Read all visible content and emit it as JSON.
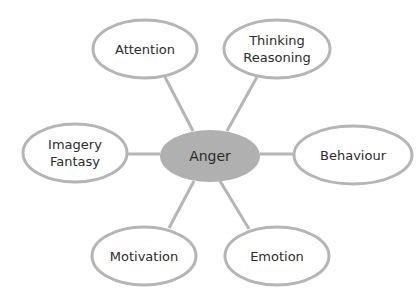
{
  "diagram": {
    "type": "mind-map",
    "colors": {
      "stroke": "#b5b5b5",
      "center_fill": "#b0b0b0",
      "node_fill": "#ffffff",
      "text": "#2b2b2b"
    },
    "center": {
      "label": "Anger",
      "cx": 210,
      "cy": 156,
      "rx": 50,
      "ry": 26
    },
    "nodes": [
      {
        "id": "attention",
        "lines": [
          "Attention"
        ],
        "cx": 145,
        "cy": 49,
        "rx": 52,
        "ry": 29
      },
      {
        "id": "thinking-reasoning",
        "lines": [
          "Thinking",
          "Reasoning"
        ],
        "cx": 277,
        "cy": 49,
        "rx": 53,
        "ry": 29
      },
      {
        "id": "imagery-fantasy",
        "lines": [
          "Imagery",
          "Fantasy"
        ],
        "cx": 75,
        "cy": 153,
        "rx": 52,
        "ry": 29
      },
      {
        "id": "behaviour",
        "lines": [
          "Behaviour"
        ],
        "cx": 353,
        "cy": 155,
        "rx": 59,
        "ry": 29
      },
      {
        "id": "motivation",
        "lines": [
          "Motivation"
        ],
        "cx": 144,
        "cy": 256,
        "rx": 52,
        "ry": 29
      },
      {
        "id": "emotion",
        "lines": [
          "Emotion"
        ],
        "cx": 277,
        "cy": 256,
        "rx": 52,
        "ry": 29
      }
    ],
    "edges": [
      {
        "from": "anger",
        "to": "attention",
        "x1": 193,
        "y1": 131,
        "x2": 165,
        "y2": 77
      },
      {
        "from": "anger",
        "to": "thinking-reasoning",
        "x1": 227,
        "y1": 131,
        "x2": 257,
        "y2": 77
      },
      {
        "from": "anger",
        "to": "imagery-fantasy",
        "x1": 160,
        "y1": 154,
        "x2": 127,
        "y2": 154
      },
      {
        "from": "anger",
        "to": "behaviour",
        "x1": 260,
        "y1": 154,
        "x2": 294,
        "y2": 154
      },
      {
        "from": "anger",
        "to": "motivation",
        "x1": 194,
        "y1": 181,
        "x2": 169,
        "y2": 228
      },
      {
        "from": "anger",
        "to": "emotion",
        "x1": 220,
        "y1": 181,
        "x2": 249,
        "y2": 229
      }
    ]
  }
}
